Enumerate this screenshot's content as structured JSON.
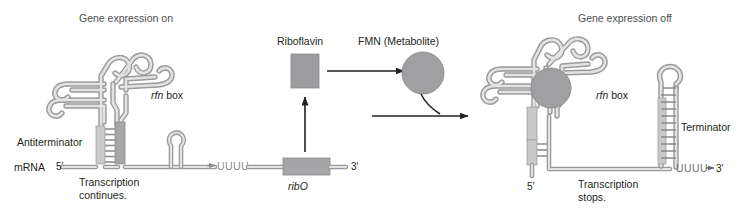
{
  "figure": {
    "type": "riboswitch-mechanism-diagram",
    "background_color": "#ffffff",
    "ink_color": "#231f20",
    "rna_color": "#9a9a9c",
    "blob_color": "#a0a0a2"
  },
  "left_panel": {
    "title": "Gene expression on",
    "antiterminator_label": "Antiterminator",
    "mrna_label": "mRNA",
    "five_prime": "5′",
    "rfn_box_italic": "rfn",
    "rfn_box_rest": " box",
    "poly_u": "UUUU",
    "caption_line1": "Transcription",
    "caption_line2": "continues."
  },
  "middle_panel": {
    "riboflavin_label": "Riboflavin",
    "fmn_label": "FMN (Metabolite)",
    "ribo_gene_italic": "ribO",
    "three_prime": "3′"
  },
  "right_panel": {
    "title": "Gene expression off",
    "rfn_box_italic": "rfn",
    "rfn_box_rest": " box",
    "terminator_label": "Terminator",
    "five_prime": "5′",
    "poly_u": "UUUU",
    "three_prime": "3′",
    "caption_line1": "Transcription",
    "caption_line2": "stops."
  }
}
